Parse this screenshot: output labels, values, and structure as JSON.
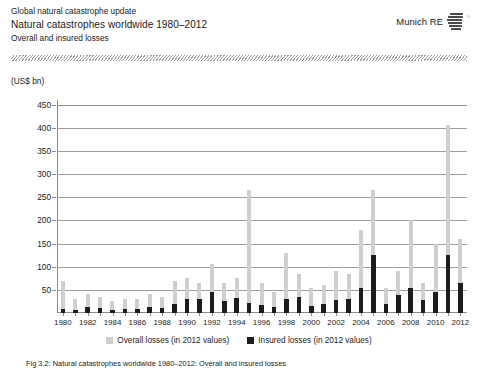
{
  "header": {
    "line1": "Global natural catastrophe update",
    "line2": "Natural catastrophes worldwide 1980–2012",
    "line3": "Overall and insured losses",
    "brand": "Munich RE",
    "brand_registered": "®"
  },
  "footnote": "Fig 3.2: Natural catastrophes worldwide 1980–2012: Overall and insured losses",
  "colors": {
    "overall": "#cfcfcf",
    "insured": "#1c1c1c",
    "axis": "#8c8c8c",
    "grid": "#9d9d9d",
    "text": "#1a1a1a"
  },
  "chart_data": {
    "type": "bar",
    "title": "Natural catastrophes worldwide 1980–2012",
    "subtitle": "Overall and insured losses",
    "xlabel": "",
    "ylabel": "(US$ bn)",
    "ylim": [
      0,
      460
    ],
    "yticks": [
      50,
      100,
      150,
      200,
      250,
      300,
      350,
      400,
      450
    ],
    "grid": true,
    "legend_position": "bottom",
    "x_tick_labels": [
      "1980",
      "1982",
      "1984",
      "1986",
      "1988",
      "1990",
      "1992",
      "1994",
      "1996",
      "1998",
      "2000",
      "2002",
      "2004",
      "2006",
      "2008",
      "2010",
      "2012"
    ],
    "categories": [
      "1980",
      "1981",
      "1982",
      "1983",
      "1984",
      "1985",
      "1986",
      "1987",
      "1988",
      "1989",
      "1990",
      "1991",
      "1992",
      "1993",
      "1994",
      "1995",
      "1996",
      "1997",
      "1998",
      "1999",
      "2000",
      "2001",
      "2002",
      "2003",
      "2004",
      "2005",
      "2006",
      "2007",
      "2008",
      "2009",
      "2010",
      "2011",
      "2012"
    ],
    "series": [
      {
        "name": "Overall losses (in 2012 values)",
        "color": "#cfcfcf",
        "values": [
          70,
          30,
          40,
          35,
          25,
          30,
          30,
          40,
          35,
          70,
          75,
          65,
          105,
          65,
          75,
          265,
          65,
          45,
          130,
          85,
          55,
          60,
          90,
          85,
          180,
          265,
          55,
          90,
          200,
          65,
          150,
          405,
          160
        ]
      },
      {
        "name": "Insured losses (in 2012 values)",
        "color": "#1c1c1c",
        "values": [
          8,
          6,
          12,
          10,
          7,
          8,
          8,
          12,
          10,
          20,
          30,
          30,
          45,
          25,
          32,
          22,
          18,
          14,
          30,
          35,
          15,
          20,
          28,
          30,
          55,
          125,
          20,
          38,
          55,
          28,
          45,
          125,
          65
        ]
      }
    ]
  },
  "legend": [
    {
      "label": "Overall losses (in 2012 values)",
      "swatch": "overall"
    },
    {
      "label": "Insured losses (in 2012 values)",
      "swatch": "insured"
    }
  ]
}
